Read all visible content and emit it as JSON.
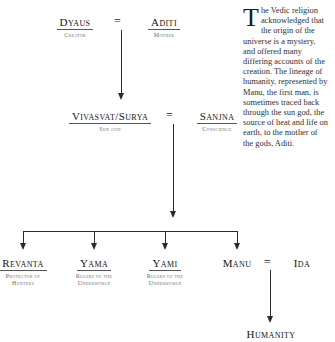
{
  "diagram": {
    "generation1": {
      "father": {
        "name": "Dyaus",
        "role": "Creator"
      },
      "union_sign": "=",
      "mother": {
        "name": "Aditi",
        "role": "Mother"
      }
    },
    "generation2": {
      "father": {
        "name": "Vivasvat/Surya",
        "role": "Sun god"
      },
      "union_sign": "=",
      "mother": {
        "name": "Sanjna",
        "role": "Conscience"
      }
    },
    "generation3": [
      {
        "name": "Revanta",
        "role_line1": "Protector of",
        "role_line2": "Hunters"
      },
      {
        "name": "Yama",
        "role_line1": "Rulers of the",
        "role_line2": "Underworld"
      },
      {
        "name": "Yami",
        "role_line1": "Rulers of the",
        "role_line2": "Underworld"
      },
      {
        "name": "Manu",
        "role_line1": "",
        "role_line2": ""
      }
    ],
    "generation3_spouse": {
      "name": "Ida",
      "union_sign": "="
    },
    "generation4": {
      "name": "Humanity"
    }
  },
  "sidebar_text": {
    "dropcap": "T",
    "body": "he Vedic religion acknowledged that the origin of the universe is a mystery, and offered many differing accounts of the creation. The lineage of humanity, represented by Manu, the first man, is sometimes traced back through the sun god, the source of heat and life on earth, to the mother of the gods, Aditi."
  },
  "colors": {
    "ink": "#1a1a1a",
    "rule": "#2b2b2b",
    "muted": "#6b6b6b",
    "background": "#ffffff"
  }
}
